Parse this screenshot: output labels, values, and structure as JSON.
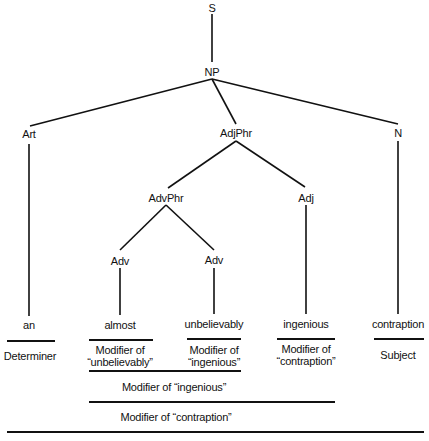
{
  "diagram": {
    "type": "syntax-tree",
    "nodes": {
      "s": "S",
      "np": "NP",
      "art": "Art",
      "adjphr": "AdjPhr",
      "n": "N",
      "advphr": "AdvPhr",
      "adj": "Adj",
      "adv1": "Adv",
      "adv2": "Adv"
    },
    "words": {
      "an": "an",
      "almost": "almost",
      "unbelievably": "unbelievably",
      "ingenious": "ingenious",
      "contraption": "contraption"
    },
    "functions": {
      "an_line1": "Determiner",
      "almost_line1": "Modifier of",
      "almost_line2": "“unbelievably”",
      "unbelievably_line1": "Modifier of",
      "unbelievably_line2": "“ingenious”",
      "ingenious_line1": "Modifier of",
      "ingenious_line2": "“contraption”",
      "contraption_line1": "Subject",
      "advphr_function": "Modifier of “ingenious”",
      "adjphr_function": "Modifier of “contraption”"
    }
  }
}
